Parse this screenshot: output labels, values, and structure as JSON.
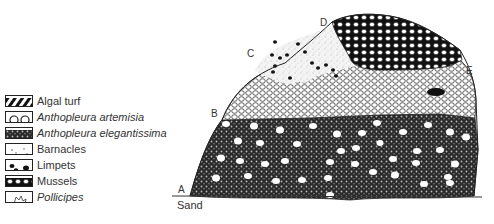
{
  "figure": {
    "type": "rocky-intertidal zonation cross-section",
    "point_labels": [
      "A",
      "B",
      "C",
      "D",
      "E"
    ],
    "substrate_label": "Sand"
  },
  "legend": {
    "items": [
      {
        "label": "Algal turf",
        "italic": false,
        "pattern": "diagonal-stripes"
      },
      {
        "label": "Anthopleura artemisia",
        "italic": true,
        "pattern": "open-circles"
      },
      {
        "label": "Anthopleura elegantissima",
        "italic": true,
        "pattern": "dense-crosshatch-cells"
      },
      {
        "label": "Barnacles",
        "italic": false,
        "pattern": "stipple-dots"
      },
      {
        "label": "Limpets",
        "italic": false,
        "pattern": "black-ovals"
      },
      {
        "label": "Mussels",
        "italic": false,
        "pattern": "black-dense-cells"
      },
      {
        "label": "Pollicipes",
        "italic": true,
        "pattern": "outlined-cluster"
      }
    ]
  },
  "colors": {
    "ink": "#222222",
    "paper": "#ffffff"
  }
}
